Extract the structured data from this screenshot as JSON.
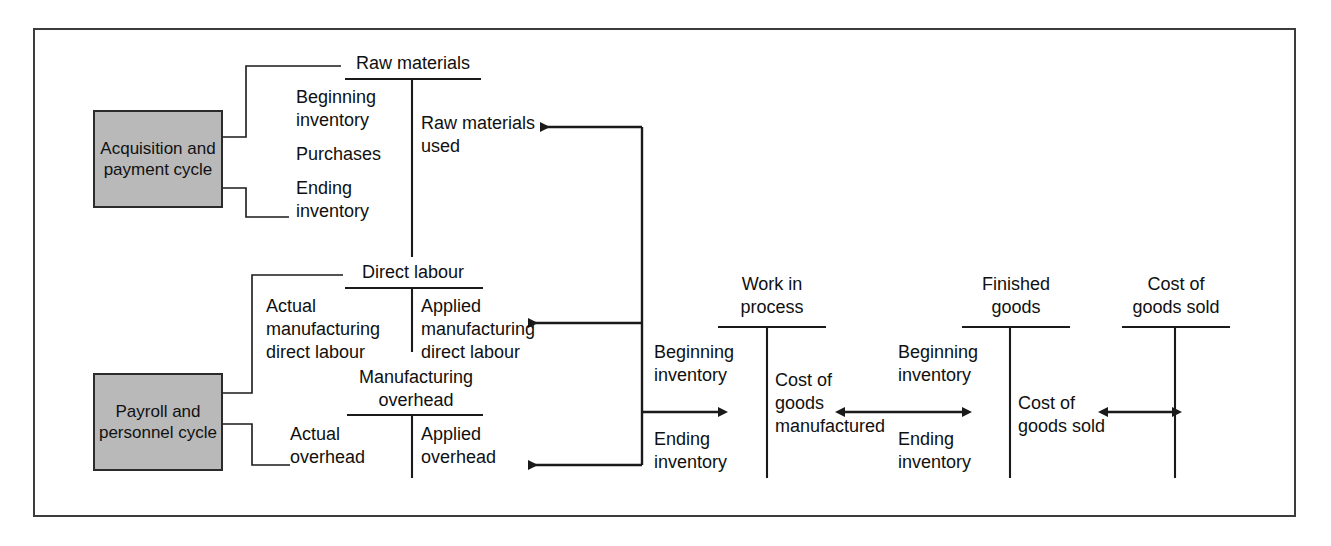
{
  "diagram": {
    "frame_color": "#3c3c3c",
    "box_fill": "#b9b9b9",
    "line_color": "#1a1a1a"
  },
  "cycles": [
    {
      "name": "acquisition-and-payment-cycle",
      "label": "Acquisition\nand payment\ncycle"
    },
    {
      "name": "payroll-and-personnel-cycle",
      "label": "Payroll and\npersonnel\ncycle"
    }
  ],
  "accounts": [
    {
      "name": "raw-materials",
      "title": "Raw materials",
      "debits": [
        "Beginning\ninventory",
        "Purchases",
        "Ending\ninventory"
      ],
      "credits": [
        "Raw materials\nused"
      ]
    },
    {
      "name": "direct-labour",
      "title": "Direct labour",
      "debits": [
        "Actual\nmanufacturing\ndirect labour"
      ],
      "credits": [
        "Applied\nmanufacturing\ndirect labour"
      ]
    },
    {
      "name": "manufacturing-overhead",
      "title": "Manufacturing\noverhead",
      "debits": [
        "Actual\noverhead"
      ],
      "credits": [
        "Applied\noverhead"
      ]
    },
    {
      "name": "work-in-process",
      "title": "Work in\nprocess",
      "debits": [
        "Beginning\ninventory",
        "Ending\ninventory"
      ],
      "credits": [
        "Cost of\ngoods\nmanufactured"
      ]
    },
    {
      "name": "finished-goods",
      "title": "Finished\ngoods",
      "debits": [
        "Beginning\ninventory",
        "Ending\ninventory"
      ],
      "credits": [
        "Cost of\ngoods sold"
      ]
    },
    {
      "name": "cost-of-goods-sold",
      "title": "Cost of\ngoods sold",
      "debits": [],
      "credits": []
    }
  ],
  "labels": {
    "raw_materials_title": "Raw materials",
    "rm_beginning": "Beginning\ninventory",
    "rm_purchases": "Purchases",
    "rm_ending": "Ending\ninventory",
    "rm_used": "Raw materials\nused",
    "direct_labour_title": "Direct labour",
    "dl_actual": "Actual\nmanufacturing\ndirect labour",
    "dl_applied": "Applied\nmanufacturing\ndirect labour",
    "moh_title": "Manufacturing\noverhead",
    "moh_actual": "Actual\noverhead",
    "moh_applied": "Applied\noverhead",
    "wip_title": "Work in\nprocess",
    "wip_beginning": "Beginning\ninventory",
    "wip_ending": "Ending\ninventory",
    "wip_cogm": "Cost of\ngoods\nmanufactured",
    "fg_title": "Finished\ngoods",
    "fg_beginning": "Beginning\ninventory",
    "fg_ending": "Ending\ninventory",
    "fg_cogs": "Cost of\ngoods sold",
    "cogs_title": "Cost of\ngoods sold",
    "acquisition_cycle": "Acquisition\nand payment\ncycle",
    "payroll_cycle": "Payroll and\npersonnel\ncycle"
  }
}
